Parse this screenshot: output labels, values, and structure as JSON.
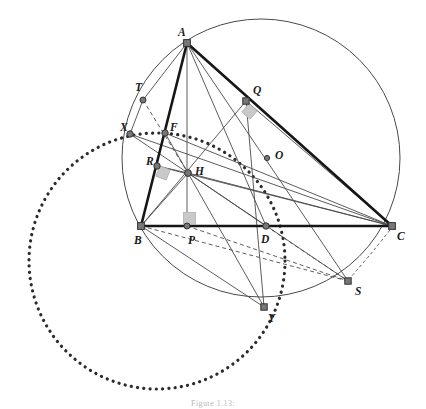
{
  "figure": {
    "caption": "Figure 1.13:",
    "caption_y": 399,
    "background": "#ffffff",
    "stroke_dark": "#3a3a3a",
    "stroke_thin": "#4a4a4a",
    "node_fill": "#777777",
    "node_stroke": "#333333",
    "marker_fill": "#c9c9c9",
    "marker_stroke": "#b0b0b0"
  },
  "labels": [
    {
      "name": "A",
      "text": "A",
      "x": 178,
      "y": 36
    },
    {
      "name": "B",
      "text": "B",
      "x": 134,
      "y": 244
    },
    {
      "name": "C",
      "text": "C",
      "x": 397,
      "y": 240
    },
    {
      "name": "D",
      "text": "D",
      "x": 261,
      "y": 243
    },
    {
      "name": "F",
      "text": "F",
      "x": 170,
      "y": 131
    },
    {
      "name": "H",
      "text": "H",
      "x": 195,
      "y": 175
    },
    {
      "name": "O",
      "text": "O",
      "x": 275,
      "y": 159
    },
    {
      "name": "P",
      "text": "P",
      "x": 188,
      "y": 244
    },
    {
      "name": "Q",
      "text": "Q",
      "x": 253,
      "y": 94
    },
    {
      "name": "R",
      "text": "R",
      "x": 146,
      "y": 165
    },
    {
      "name": "S",
      "text": "S",
      "x": 355,
      "y": 295
    },
    {
      "name": "T",
      "text": "T",
      "x": 135,
      "y": 91
    },
    {
      "name": "X",
      "text": "X",
      "x": 120,
      "y": 131
    },
    {
      "name": "Y",
      "text": "Y",
      "x": 268,
      "y": 322
    }
  ],
  "points": [
    {
      "name": "A",
      "x": 187,
      "y": 43,
      "r": 3.4,
      "shape": "square"
    },
    {
      "name": "B",
      "x": 141,
      "y": 226,
      "r": 3.4,
      "shape": "square"
    },
    {
      "name": "C",
      "x": 392,
      "y": 226,
      "r": 3.4,
      "shape": "square"
    },
    {
      "name": "D",
      "x": 266,
      "y": 226,
      "r": 3.2,
      "shape": "circle"
    },
    {
      "name": "F",
      "x": 165,
      "y": 133,
      "r": 3.2,
      "shape": "circle"
    },
    {
      "name": "H",
      "x": 188,
      "y": 173,
      "r": 3.4,
      "shape": "circle"
    },
    {
      "name": "O",
      "x": 267,
      "y": 158,
      "r": 2.6,
      "shape": "circle"
    },
    {
      "name": "P",
      "x": 187,
      "y": 226,
      "r": 3.0,
      "shape": "circle"
    },
    {
      "name": "Q",
      "x": 246,
      "y": 101,
      "r": 3.2,
      "shape": "square"
    },
    {
      "name": "R",
      "x": 157,
      "y": 166,
      "r": 3.2,
      "shape": "circle"
    },
    {
      "name": "S",
      "x": 348,
      "y": 281,
      "r": 3.2,
      "shape": "square"
    },
    {
      "name": "T",
      "x": 143,
      "y": 100,
      "r": 3.0,
      "shape": "circle"
    },
    {
      "name": "X",
      "x": 130,
      "y": 134,
      "r": 3.2,
      "shape": "circle"
    },
    {
      "name": "Y",
      "x": 264,
      "y": 307,
      "r": 3.2,
      "shape": "square"
    }
  ],
  "circles": [
    {
      "name": "circumcircle-ABC",
      "cx": 261,
      "cy": 158,
      "r": 139,
      "style": "solid",
      "stroke": "#4a4a4a",
      "width": 1.0
    },
    {
      "name": "dotted-circle-XFY",
      "cx": 157,
      "cy": 261,
      "r": 128,
      "style": "dotted",
      "stroke": "#2b2b2b",
      "width": 3.2
    }
  ],
  "thick_segments": [
    {
      "name": "side-AB",
      "from": "A",
      "to": "B"
    },
    {
      "name": "side-AC",
      "from": "A",
      "to": "C"
    },
    {
      "name": "side-BC",
      "from": "B",
      "to": "C"
    }
  ],
  "thin_segments": [
    {
      "name": "altitude-AP",
      "from": "A",
      "to": "P"
    },
    {
      "name": "cevian-AD",
      "from": "A",
      "to": "D"
    },
    {
      "name": "cevian-AS",
      "from": "A",
      "to": "S"
    },
    {
      "name": "cevian-BQ",
      "from": "B",
      "to": "Q"
    },
    {
      "name": "segment-QC-chord",
      "from": "Q",
      "to": "C"
    },
    {
      "name": "segment-CF",
      "from": "C",
      "to": "F"
    },
    {
      "name": "segment-CR",
      "from": "C",
      "to": "R"
    },
    {
      "name": "segment-CX",
      "from": "C",
      "to": "X"
    },
    {
      "name": "segment-HB",
      "from": "H",
      "to": "B"
    },
    {
      "name": "segment-HC",
      "from": "H",
      "to": "C"
    },
    {
      "name": "segment-HD",
      "from": "H",
      "to": "D"
    },
    {
      "name": "segment-HS",
      "from": "H",
      "to": "S"
    },
    {
      "name": "segment-HY",
      "from": "H",
      "to": "Y"
    },
    {
      "name": "segment-HX",
      "from": "H",
      "to": "X"
    },
    {
      "name": "segment-HF",
      "from": "H",
      "to": "F"
    },
    {
      "name": "segment-HR",
      "from": "H",
      "to": "R"
    },
    {
      "name": "segment-BY",
      "from": "B",
      "to": "Y"
    },
    {
      "name": "segment-XT",
      "from": "X",
      "to": "T"
    },
    {
      "name": "segment-TA",
      "from": "T",
      "to": "A"
    },
    {
      "name": "segment-OQ-ray",
      "from": "Q",
      "to": "Y"
    }
  ],
  "dashed_segments": [
    {
      "name": "dashed-TH",
      "from": "T",
      "to": "H"
    },
    {
      "name": "dashed-BS",
      "from": "B",
      "to": "S"
    },
    {
      "name": "dashed-DS",
      "from": "D",
      "to": "S"
    },
    {
      "name": "dashed-PS",
      "from": "P",
      "to": "S"
    }
  ],
  "right_angle_markers": [
    {
      "name": "right-angle-at-Q",
      "cx": 249.5,
      "cy": 111.5,
      "size": 11,
      "rotate": 41
    },
    {
      "name": "right-angle-at-R",
      "cx": 163,
      "cy": 173,
      "size": 11,
      "rotate": 21
    },
    {
      "name": "right-angle-at-P",
      "cx": 189.5,
      "cy": 218.5,
      "size": 12,
      "rotate": 0
    }
  ],
  "arcs": [
    {
      "name": "dashed-arc-CS",
      "d": "M 390 230 Q 368 258 349 279"
    }
  ]
}
